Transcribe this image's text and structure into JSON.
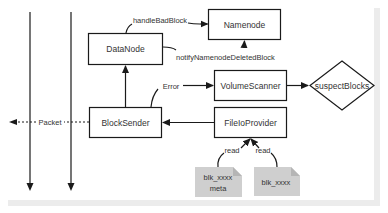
{
  "diagram": {
    "nodes": {
      "namenode": {
        "label": "Namenode"
      },
      "datanode": {
        "label": "DataNode"
      },
      "volume_scanner": {
        "label": "VolumeScanner"
      },
      "suspect_blocks": {
        "label": "suspectBlocks"
      },
      "block_sender": {
        "label": "BlockSender"
      },
      "file_io_provider": {
        "label": "FileIoProvider"
      },
      "blk_meta_file": {
        "line1": "blk_xxxx",
        "line2": "meta"
      },
      "blk_file": {
        "label": "blk_xxxx"
      }
    },
    "edges": {
      "handle_bad_block": {
        "label": "handleBadBlock",
        "from": "DataNode",
        "to": "Namenode"
      },
      "notify_deleted": {
        "label": "notifyNamenodeDeletedBlock",
        "from": "DataNode",
        "to": "Namenode"
      },
      "error": {
        "label": "Error",
        "from": "BlockSender",
        "to": "VolumeScanner"
      },
      "packet": {
        "label": "Packet",
        "from": "BlockSender",
        "to": "client"
      },
      "read_meta": {
        "label": "read",
        "from": "blk_xxxx.meta",
        "to": "FileIoProvider"
      },
      "read_blk": {
        "label": "read",
        "from": "blk_xxxx",
        "to": "FileIoProvider"
      }
    },
    "colors": {
      "stroke": "#1a1a1a",
      "file_fill": "#cfcfcf",
      "file_fold": "#b5b5b5",
      "frame": "#ececec"
    }
  }
}
